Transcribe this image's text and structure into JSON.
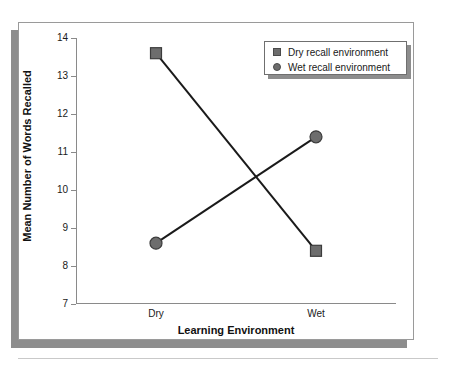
{
  "chart_data": {
    "type": "line",
    "title": "",
    "xlabel": "Learning Environment",
    "ylabel": "Mean Number of Words Recalled",
    "categories": [
      "Dry",
      "Wet"
    ],
    "ylim": [
      7,
      14
    ],
    "yticks": [
      7,
      8,
      9,
      10,
      11,
      12,
      13,
      14
    ],
    "ytick_labels": [
      "7",
      "8",
      "9",
      "10",
      "11",
      "12",
      "13",
      "14"
    ],
    "grid": false,
    "legend_position": "top-right",
    "series": [
      {
        "name": "Dry recall environment",
        "marker": "square",
        "color": "#6d6d6d",
        "line_color": "#1a1a1a",
        "values": [
          13.6,
          8.4
        ]
      },
      {
        "name": "Wet recall environment",
        "marker": "circle",
        "color": "#6d6d6d",
        "line_color": "#1a1a1a",
        "values": [
          8.6,
          11.4
        ]
      }
    ]
  },
  "axis": {
    "y_title": "Mean Number of Words Recalled",
    "x_title": "Learning Environment",
    "y_labels": [
      "14",
      "13",
      "12",
      "11",
      "10",
      "9",
      "8",
      "7"
    ],
    "x_labels": [
      "Dry",
      "Wet"
    ]
  },
  "legend": {
    "items": [
      {
        "label": "Dry recall environment",
        "marker": "square-marker-icon"
      },
      {
        "label": "Wet recall environment",
        "marker": "circle-marker-icon"
      }
    ]
  }
}
